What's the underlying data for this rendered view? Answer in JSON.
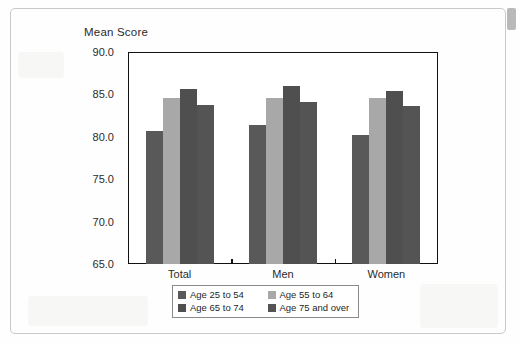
{
  "chart_data": {
    "type": "bar",
    "title": "",
    "ylabel": "Mean Score",
    "xlabel": "",
    "categories": [
      "Total",
      "Men",
      "Women"
    ],
    "series": [
      {
        "name": "Age 25 to 54",
        "color": "#595959",
        "values": [
          80.7,
          81.4,
          80.2
        ]
      },
      {
        "name": "Age 55 to 64",
        "color": "#a8a8a8",
        "values": [
          84.6,
          84.6,
          84.6
        ]
      },
      {
        "name": "Age 65 to 74",
        "color": "#4f4f4f",
        "values": [
          85.6,
          86.0,
          85.4
        ]
      },
      {
        "name": "Age 75 and over",
        "color": "#545454",
        "values": [
          83.7,
          84.1,
          83.6
        ]
      }
    ],
    "ylim": [
      65.0,
      90.0
    ],
    "ytick_values": [
      90.0,
      85.0,
      80.0,
      75.0,
      70.0,
      65.0
    ],
    "ytick_labels": [
      "90.0",
      "85.0",
      "80.0",
      "75.0",
      "70.0",
      "65.0"
    ],
    "grid": false,
    "legend_position": "bottom",
    "legend_entries": [
      "Age 25 to 54",
      "Age 55 to 64",
      "Age 65 to 74",
      "Age 75 and over"
    ]
  },
  "colors": {
    "axis": "#111111",
    "text": "#2b2b2b",
    "frame": "#c9c9c9",
    "plot_background": "#ffffff"
  }
}
